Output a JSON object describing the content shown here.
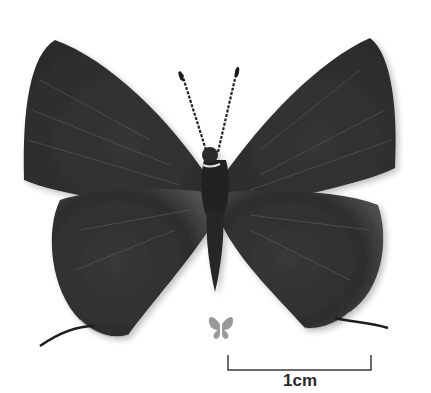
{
  "image": {
    "subject": "butterfly specimen, dorsal view",
    "colors": {
      "background": "#ffffff",
      "wing": "#3a3a3a",
      "wing_dark": "#262626",
      "wing_light": "#5a5a5a",
      "body": "#222222",
      "size_icon": "#9a9a9a",
      "scale_bar": "#3a3a3a"
    }
  },
  "scale_bar": {
    "label": "1cm"
  },
  "size_icon": {
    "name": "actual-size-butterfly-icon"
  }
}
